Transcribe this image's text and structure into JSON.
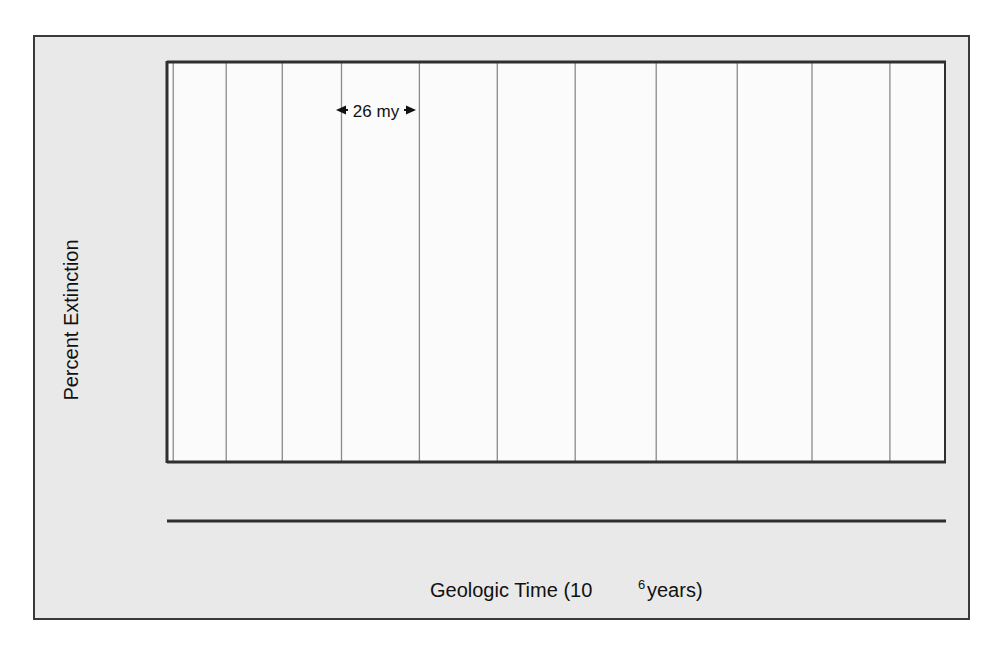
{
  "figure": {
    "background_color": "#e9e9e9",
    "plot_background_color": "#fbfbfb",
    "frame_color": "#3a3a3a",
    "curve_color": "#5a5a5a",
    "shade_color": "#b4b4b4",
    "gridline_color": "#8a8a8a"
  },
  "chart_data": {
    "type": "area",
    "title": "",
    "xlabel": "Geologic Time (10",
    "xlabel_sup": "6",
    "xlabel_tail": " years)",
    "ylabel": "Percent Extinction",
    "xscale": "linear-reversed",
    "yscale": "log",
    "xlim": [
      250,
      0
    ],
    "ylim": [
      1.85,
      72
    ],
    "xticks": [
      250,
      200,
      150,
      100,
      50,
      0
    ],
    "xticklabels": [
      "250",
      "200",
      "150",
      "100",
      "50",
      "0"
    ],
    "yticks": [
      70,
      50,
      30,
      20,
      10,
      5,
      2
    ],
    "yticklabels": [
      "70",
      "50",
      "30",
      "20",
      "10",
      "5",
      "2"
    ],
    "grid": "vertical-only",
    "legend": "none",
    "annotation": {
      "text": "←26 my→",
      "plain_text": "26 my",
      "x_start": 222,
      "x_end": 196,
      "y": 42
    },
    "periodicity_gridlines_my": [
      248,
      231,
      213,
      194,
      169,
      144,
      119,
      93,
      67,
      43,
      18
    ],
    "x": [
      250,
      248.5,
      246.5,
      244.5,
      241,
      237.5,
      234,
      230,
      226.5,
      222.5,
      219,
      215,
      211,
      208,
      205.5,
      204.5,
      202,
      198,
      195,
      192.5,
      190,
      187.5,
      184,
      181,
      177.5,
      174.5,
      171.5,
      168,
      165,
      161,
      157.5,
      154.5,
      152,
      148.5,
      145,
      141.5,
      138.5,
      134.5,
      131,
      127,
      123.5,
      119.5,
      116,
      112,
      108,
      104,
      100,
      96,
      92,
      88.5,
      85,
      81,
      77,
      73,
      69,
      65,
      61.5,
      58,
      54.5,
      50.5,
      47,
      43,
      39.5,
      36,
      32,
      28,
      24,
      20,
      16,
      12,
      8,
      5
    ],
    "percent_extinction": [
      52,
      52,
      51.5,
      52,
      31,
      22,
      17,
      13,
      14,
      18,
      24,
      31,
      38,
      30,
      20,
      11,
      7,
      3,
      2.9,
      5,
      8.5,
      10,
      13,
      12.5,
      9,
      7.2,
      8.5,
      10.5,
      11.5,
      8,
      5.5,
      3.4,
      5.5,
      7,
      6.5,
      5.6,
      6.5,
      8,
      10,
      14,
      20,
      12,
      6.5,
      3.9,
      3.5,
      3.7,
      5.5,
      9,
      5.7,
      8,
      9.5,
      9.3,
      9.8,
      10.5,
      11.5,
      13,
      18.5,
      5.8,
      9.5,
      13,
      17,
      23,
      40,
      68,
      21,
      21,
      29,
      41,
      30,
      18,
      11.5,
      25,
      13.5
    ],
    "background_trend_note": "Smooth lower envelope; shaded region lies between the extinction curve peaks and this background level",
    "periods": [
      {
        "name": "Triassic",
        "start_my": 248,
        "end_my": 213
      },
      {
        "name": "Jurassic",
        "start_my": 213,
        "end_my": 144
      },
      {
        "name": "Cretaceous",
        "start_my": 144,
        "end_my": 65
      },
      {
        "name": "Tertiary",
        "start_my": 65,
        "end_my": 2
      }
    ]
  }
}
